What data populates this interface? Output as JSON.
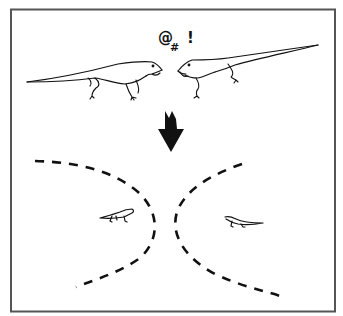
{
  "figure": {
    "frame": {
      "x": 11,
      "y": 9,
      "width": 324,
      "height": 303,
      "stroke": "#555555"
    },
    "ink_color": "#111111",
    "top_panel": {
      "speech": {
        "symbol_1": "@",
        "symbol_2": "#",
        "symbol_3": "!"
      },
      "lizards": [
        {
          "label": "lizard-left",
          "facing": "right"
        },
        {
          "label": "lizard-right",
          "facing": "left"
        }
      ]
    },
    "arrow": {
      "direction": "down"
    },
    "bottom_panel": {
      "boundaries": [
        {
          "label": "left-territory-boundary",
          "style": "dashed"
        },
        {
          "label": "right-territory-boundary",
          "style": "dashed"
        }
      ],
      "lizards": [
        {
          "label": "small-lizard-left",
          "facing": "right"
        },
        {
          "label": "small-lizard-right",
          "facing": "left"
        }
      ]
    }
  }
}
